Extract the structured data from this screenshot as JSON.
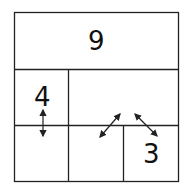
{
  "diagram": {
    "type": "cage-grid",
    "cells": [
      {
        "id": "top",
        "label": "9"
      },
      {
        "id": "middle-left",
        "label": "4"
      },
      {
        "id": "middle-right",
        "label": ""
      },
      {
        "id": "bottom-left",
        "label": ""
      },
      {
        "id": "bottom-middle",
        "label": ""
      },
      {
        "id": "bottom-right",
        "label": "3"
      }
    ],
    "arrows": [
      {
        "name": "vertical-double-arrow",
        "from": "middle-left",
        "to": "bottom-left"
      },
      {
        "name": "diagonal-double-arrow-left",
        "from": "middle-right",
        "to": "bottom-middle"
      },
      {
        "name": "diagonal-double-arrow-right",
        "from": "middle-right",
        "to": "bottom-right"
      }
    ],
    "line_color": "#222222"
  }
}
